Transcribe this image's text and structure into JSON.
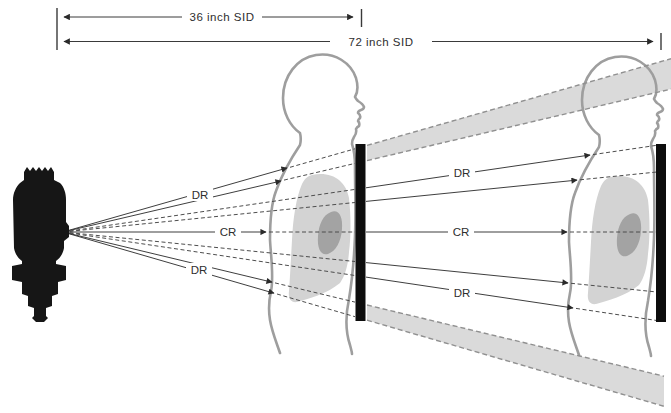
{
  "diagram": {
    "kind": "xray-beam-divergence-comparison",
    "measurements": {
      "sid_36": "36 inch SID",
      "sid_72": "72 inch SID"
    },
    "ray_labels": {
      "dr": "DR",
      "cr": "CR"
    },
    "colors": {
      "background": "#ffffff",
      "body_outline": "#9e9e9e",
      "lung_fill": "#d3d3d3",
      "heart_fill": "#a3a3a3",
      "receptor_fill": "#0d0d0d",
      "tube_fill": "#161616",
      "ray_color": "#343434",
      "beam_band_fill": "#dadada",
      "beam_band_edge": "#909090",
      "label_color": "#2e2e2e"
    }
  }
}
